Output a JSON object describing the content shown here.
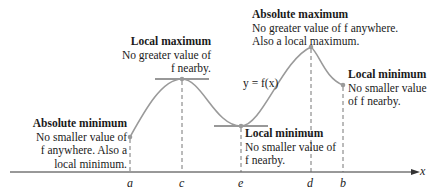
{
  "diagram": {
    "function_label": "y = f(x)",
    "axis_label": "x",
    "points": {
      "a": "a",
      "c": "c",
      "e": "e",
      "d": "d",
      "b": "b"
    },
    "annotations": {
      "abs_min": {
        "title": "Absolute minimum",
        "line1": "No smaller value of",
        "line2": "f anywhere. Also a",
        "line3": "local minimum."
      },
      "local_max": {
        "title": "Local maximum",
        "line1": "No greater value of",
        "line2": "f nearby."
      },
      "local_min_e": {
        "title": "Local minimum",
        "line1": "No smaller value of",
        "line2": "f nearby."
      },
      "abs_max": {
        "title": "Absolute maximum",
        "line1": "No greater value of f anywhere.",
        "line2": "Also a local maximum."
      },
      "local_min_b": {
        "title": "Local minimum",
        "line1": "No smaller value",
        "line2": "of f nearby."
      }
    },
    "colors": {
      "curve": "#9a9a9a",
      "axis": "#333333",
      "point": "#9a9a9a"
    }
  }
}
